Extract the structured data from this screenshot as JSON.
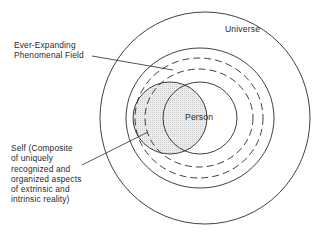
{
  "diagram": {
    "title": "",
    "labels": {
      "universe": "Universe",
      "person": "Person",
      "field_lines": [
        "Ever-Expanding",
        "Phenomenal Field"
      ],
      "self_lines": [
        "Self (Composite",
        "of uniquely",
        "recognized and",
        "organized aspects",
        "of extrinsic and",
        "intrinsic reality)"
      ]
    },
    "elements": [
      {
        "id": "universe",
        "shape": "circle",
        "style": "solid",
        "label": "Universe"
      },
      {
        "id": "phenomenal-field-outer",
        "shape": "circle",
        "style": "solid"
      },
      {
        "id": "phenomenal-field-dashed-1",
        "shape": "circle",
        "style": "dashed"
      },
      {
        "id": "phenomenal-field-dashed-2",
        "shape": "circle",
        "style": "dashed"
      },
      {
        "id": "person",
        "shape": "circle",
        "style": "solid",
        "label": "Person"
      },
      {
        "id": "self",
        "shape": "circle",
        "style": "solid",
        "fill": "shaded",
        "label": "Self"
      }
    ],
    "colors": {
      "stroke": "#2b2b2b",
      "self_fill": "#e4e4e4",
      "background": "#ffffff"
    }
  }
}
